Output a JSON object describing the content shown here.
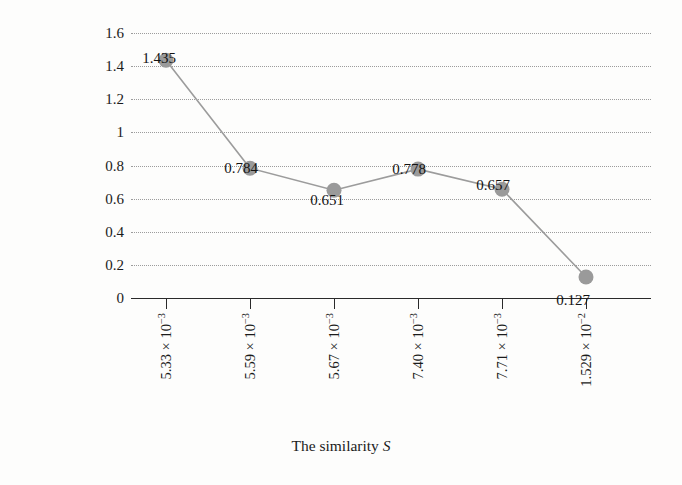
{
  "chart_data": {
    "type": "line",
    "title": "",
    "xlabel": "The similarity S",
    "ylabel": "|ΔT| of the time overhead",
    "categories": [
      "5.33 × 10⁻³",
      "5.59 × 10⁻³",
      "5.67 × 10⁻³",
      "7.40 × 10⁻³",
      "7.71 × 10⁻³",
      "1.529 × 10⁻²"
    ],
    "x_values": [
      0.00533,
      0.00559,
      0.00567,
      0.0074,
      0.00771,
      0.01529
    ],
    "values": [
      1.435,
      0.784,
      0.651,
      0.778,
      0.657,
      0.127
    ],
    "point_labels": [
      "1.435",
      "0.784",
      "0.651",
      "0.778",
      "0.657",
      "0.127"
    ],
    "ylim": [
      0,
      1.6
    ],
    "y_ticks": [
      0,
      0.2,
      0.4,
      0.6,
      0.8,
      1.0,
      1.2,
      1.4,
      1.6
    ],
    "y_tick_labels": [
      "0",
      "0.2",
      "0.4",
      "0.6",
      "0.8",
      "1",
      "1.2",
      "1.4",
      "1.6"
    ],
    "grid": "horizontal-dotted",
    "legend": "none",
    "marker": "circle",
    "marker_color": "#9a9a9a",
    "line_color": "#9c9c9c",
    "grid_color": "#8c8c8c",
    "axis_color": "#2a2a2a"
  },
  "axes": {
    "x_title": "The similarity ",
    "x_title_var": "S",
    "y_title_line1": "|ΔT| of the time",
    "y_title_line2": "overhead",
    "y_title": "|ΔT| of the time\noverhead"
  },
  "x_tick_parts": [
    {
      "mantissa": "5.33 × 10",
      "exponent": "−3"
    },
    {
      "mantissa": "5.59 × 10",
      "exponent": "−3"
    },
    {
      "mantissa": "5.67 × 10",
      "exponent": "−3"
    },
    {
      "mantissa": "7.40 × 10",
      "exponent": "−3"
    },
    {
      "mantissa": "7.71 × 10",
      "exponent": "−3"
    },
    {
      "mantissa": "1.529 × 10",
      "exponent": "−2"
    }
  ]
}
